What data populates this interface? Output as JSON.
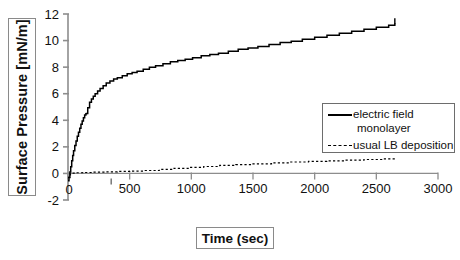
{
  "chart_data": {
    "type": "line",
    "title": "",
    "xlabel": "Time (sec)",
    "ylabel": "Surface Pressure [mN/m]",
    "xlim": [
      0,
      3000
    ],
    "ylim": [
      -2,
      12
    ],
    "xticks": [
      0,
      500,
      1000,
      1500,
      2000,
      2500,
      3000
    ],
    "yticks": [
      -2,
      0,
      2,
      4,
      6,
      8,
      10,
      12
    ],
    "grid": false,
    "legend_position": "right-middle",
    "series": [
      {
        "name": "electric field monolayer",
        "style": "solid",
        "color": "#000000",
        "x": [
          0,
          8,
          15,
          22,
          30,
          38,
          45,
          55,
          65,
          75,
          85,
          95,
          105,
          115,
          125,
          135,
          145,
          150,
          160,
          175,
          190,
          205,
          220,
          240,
          260,
          285,
          310,
          340,
          370,
          400,
          440,
          480,
          520,
          560,
          610,
          660,
          710,
          770,
          830,
          890,
          950,
          1010,
          1080,
          1150,
          1220,
          1300,
          1380,
          1460,
          1540,
          1630,
          1720,
          1810,
          1900,
          2000,
          2100,
          2200,
          2300,
          2400,
          2500,
          2600,
          2650
        ],
        "y": [
          -0.55,
          -0.3,
          0.1,
          0.5,
          0.95,
          1.35,
          1.7,
          2.1,
          2.45,
          2.8,
          3.1,
          3.4,
          3.7,
          3.95,
          4.2,
          4.4,
          4.5,
          4.52,
          4.95,
          5.35,
          5.6,
          5.8,
          6.0,
          6.2,
          6.4,
          6.6,
          6.8,
          6.95,
          7.1,
          7.2,
          7.35,
          7.5,
          7.6,
          7.7,
          7.85,
          8.0,
          8.1,
          8.25,
          8.4,
          8.5,
          8.6,
          8.7,
          8.85,
          8.95,
          9.05,
          9.2,
          9.35,
          9.45,
          9.55,
          9.7,
          9.85,
          9.95,
          10.1,
          10.25,
          10.4,
          10.55,
          10.7,
          10.85,
          11.0,
          11.15,
          11.3
        ]
      },
      {
        "name": "usual LB deposition",
        "style": "dashed",
        "color": "#000000",
        "x": [
          0,
          20,
          60,
          120,
          200,
          300,
          400,
          500,
          620,
          740,
          860,
          980,
          1100,
          1230,
          1360,
          1500,
          1650,
          1800,
          1950,
          2100,
          2250,
          2400,
          2550,
          2650
        ],
        "y": [
          -0.3,
          0.02,
          0.05,
          0.07,
          0.1,
          0.12,
          0.15,
          0.18,
          0.22,
          0.3,
          0.38,
          0.45,
          0.52,
          0.6,
          0.66,
          0.72,
          0.8,
          0.86,
          0.9,
          0.95,
          1.0,
          1.05,
          1.1,
          1.12
        ]
      }
    ]
  },
  "legend": {
    "entries": [
      {
        "label": "electric field",
        "label_line2": "monolayer",
        "style": "solid"
      },
      {
        "label": "usual LB deposition",
        "label_line2": "",
        "style": "dashed"
      }
    ]
  },
  "axes": {
    "y_title": "Surface Pressure [mN/m]",
    "x_title": "Time (sec)",
    "y_tick_labels": [
      "12",
      "10",
      "8",
      "6",
      "4",
      "2",
      "0",
      "-2"
    ],
    "x_tick_labels": [
      "0",
      "500",
      "1000",
      "1500",
      "2000",
      "2500",
      "3000"
    ]
  }
}
